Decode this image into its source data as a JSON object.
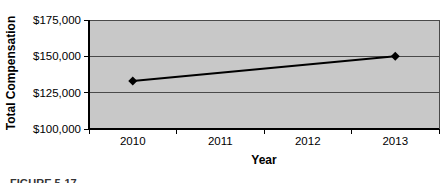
{
  "caption": "FIGURE 5-17",
  "colors": {
    "plot_bg": "#c8c8c8",
    "plot_border": "#4a4a4a",
    "grid": "#4a4a4a",
    "axis": "#000000",
    "series_line": "#000000",
    "marker": "#000000",
    "text": "#000000"
  },
  "chart_data": {
    "type": "line",
    "title": "",
    "xlabel": "Year",
    "ylabel": "Total Compensation",
    "categories": [
      "2010",
      "2011",
      "2012",
      "2013"
    ],
    "series": [
      {
        "name": "Total Compensation",
        "values": [
          133000,
          null,
          null,
          150000
        ]
      }
    ],
    "ylim": [
      100000,
      175000
    ],
    "y_ticks": [
      {
        "value": 100000,
        "label": "$100,000"
      },
      {
        "value": 125000,
        "label": "$125,000"
      },
      {
        "value": 150000,
        "label": "$150,000"
      },
      {
        "value": 175000,
        "label": "$175,000"
      }
    ],
    "grid": "horizontal",
    "legend": "none",
    "marker": "diamond"
  }
}
